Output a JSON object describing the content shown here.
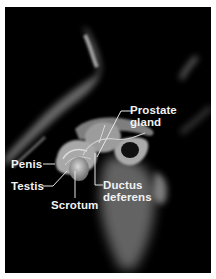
{
  "figure": {
    "background_color": "#000000",
    "labels": [
      {
        "id": "prostate",
        "line1": "Prostate",
        "line2": "gland"
      },
      {
        "id": "penis",
        "line1": "Penis"
      },
      {
        "id": "testis",
        "line1": "Testis"
      },
      {
        "id": "scrotum",
        "line1": "Scrotum"
      },
      {
        "id": "ductus",
        "line1": "Ductus",
        "line2": "deferens"
      }
    ]
  }
}
